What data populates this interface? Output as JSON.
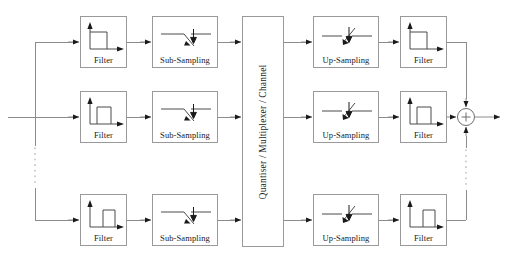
{
  "diagram": {
    "canvas": {
      "width": 511,
      "height": 263
    },
    "colors": {
      "line": "#8c8c8c",
      "box_border": "#9a9a9a",
      "text": "#1a1a1a",
      "background": "#ffffff",
      "arrow": "#1a1a1a"
    },
    "central_block": {
      "label": "Quantiser / Multiplexer / Channel",
      "orientation": "vertical",
      "x": 242,
      "y": 16,
      "w": 42,
      "h": 231
    },
    "sum_node": {
      "label": "+",
      "name": "summing-junction",
      "cx": 466,
      "cy": 117,
      "r": 9,
      "inputs": [
        "top",
        "left",
        "bottom"
      ],
      "output": "right"
    },
    "columns": [
      {
        "name": "analysis-filter",
        "label": "Filter",
        "x": 80,
        "w": 47
      },
      {
        "name": "sub-sampling",
        "label": "Sub-Sampling",
        "x": 152,
        "w": 66
      },
      {
        "name": "up-sampling",
        "label": "Up-Sampling",
        "x": 313,
        "w": 66
      },
      {
        "name": "synthesis-filter",
        "label": "Filter",
        "x": 400,
        "w": 47
      }
    ],
    "rows": [
      {
        "name": "row-1",
        "y": 16,
        "h": 52,
        "center": 42,
        "band": "low"
      },
      {
        "name": "row-2",
        "y": 91,
        "h": 52,
        "center": 117,
        "band": "mid"
      },
      {
        "name": "row-3",
        "y": 194,
        "h": 52,
        "center": 220,
        "band": "high"
      }
    ],
    "blocks": [
      {
        "id": "filter-a1",
        "name": "analysis-filter-1",
        "label": "Filter",
        "icon": "lowpass-spectrum-icon",
        "x": 80,
        "y": 16,
        "w": 47,
        "h": 52,
        "band_offset": 0.0
      },
      {
        "id": "subsample-1",
        "name": "sub-sampling-1",
        "label": "Sub-Sampling",
        "icon": "down-switch-icon",
        "x": 152,
        "y": 16,
        "w": 66,
        "h": 52
      },
      {
        "id": "upsample-1",
        "name": "up-sampling-1",
        "label": "Up-Sampling",
        "icon": "up-switch-icon",
        "x": 313,
        "y": 16,
        "w": 66,
        "h": 52
      },
      {
        "id": "filter-s1",
        "name": "synthesis-filter-1",
        "label": "Filter",
        "icon": "lowpass-spectrum-icon",
        "x": 400,
        "y": 16,
        "w": 47,
        "h": 52,
        "band_offset": 0.0
      },
      {
        "id": "filter-a2",
        "name": "analysis-filter-2",
        "label": "Filter",
        "icon": "bandpass-spectrum-icon",
        "x": 80,
        "y": 91,
        "w": 47,
        "h": 52,
        "band_offset": 0.28
      },
      {
        "id": "subsample-2",
        "name": "sub-sampling-2",
        "label": "Sub-Sampling",
        "icon": "down-switch-icon",
        "x": 152,
        "y": 91,
        "w": 66,
        "h": 52
      },
      {
        "id": "upsample-2",
        "name": "up-sampling-2",
        "label": "Up-Sampling",
        "icon": "up-switch-icon",
        "x": 313,
        "y": 91,
        "w": 66,
        "h": 52
      },
      {
        "id": "filter-s2",
        "name": "synthesis-filter-2",
        "label": "Filter",
        "icon": "bandpass-spectrum-icon",
        "x": 400,
        "y": 91,
        "w": 47,
        "h": 52,
        "band_offset": 0.28
      },
      {
        "id": "filter-a3",
        "name": "analysis-filter-3",
        "label": "Filter",
        "icon": "highband-spectrum-icon",
        "x": 80,
        "y": 194,
        "w": 47,
        "h": 52,
        "band_offset": 0.52
      },
      {
        "id": "subsample-3",
        "name": "sub-sampling-3",
        "label": "Sub-Sampling",
        "icon": "down-switch-icon",
        "x": 152,
        "y": 194,
        "w": 66,
        "h": 52
      },
      {
        "id": "upsample-3",
        "name": "up-sampling-3",
        "label": "Up-Sampling",
        "icon": "up-switch-icon",
        "x": 313,
        "y": 194,
        "w": 66,
        "h": 52
      },
      {
        "id": "filter-s3",
        "name": "synthesis-filter-3",
        "label": "Filter",
        "icon": "highband-spectrum-icon",
        "x": 400,
        "y": 194,
        "w": 47,
        "h": 52,
        "band_offset": 0.52
      }
    ],
    "buses": {
      "input_line_y": 117,
      "input_line_x_start": 8,
      "split_bus_x": 35,
      "split_bus_top": 42,
      "split_bus_bottom": 220,
      "output_bus_x": 466,
      "output_bus_top": 42,
      "output_bus_bottom": 220,
      "output_line_x_end": 503,
      "dotted_left": {
        "x": 35,
        "y1": 148,
        "y2": 186
      },
      "dotted_right": {
        "x": 466,
        "y1": 150,
        "y2": 188
      }
    },
    "ellipsis": {
      "left_name": "row-continuation-dots-left",
      "right_name": "row-continuation-dots-right",
      "style": "dotted"
    }
  }
}
